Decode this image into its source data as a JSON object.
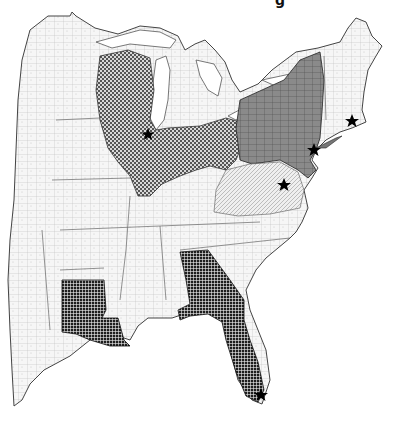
{
  "title_fragment": "g",
  "map": {
    "description": "Eastern United States county map with highlighted states",
    "colors": {
      "background": "#ffffff",
      "land": "#f4f4f4",
      "border": "#555555",
      "county_lines": "#aaaaaa",
      "midwest_checker": "#6a6a6a",
      "northeast_gray": "#7a7a7a",
      "south_grid": "#2a2a2a",
      "star": "#000000"
    },
    "highlighted_regions": [
      {
        "name": "Wisconsin",
        "pattern": "checker"
      },
      {
        "name": "Illinois",
        "pattern": "checker"
      },
      {
        "name": "Indiana",
        "pattern": "checker"
      },
      {
        "name": "Ohio",
        "pattern": "checker"
      },
      {
        "name": "New York",
        "pattern": "gray"
      },
      {
        "name": "Pennsylvania",
        "pattern": "gray"
      },
      {
        "name": "New Jersey",
        "pattern": "gray"
      },
      {
        "name": "Louisiana",
        "pattern": "grid"
      },
      {
        "name": "Georgia",
        "pattern": "grid"
      },
      {
        "name": "Florida",
        "pattern": "grid"
      }
    ],
    "stars": [
      {
        "name": "Chicago",
        "x": 148,
        "y": 134
      },
      {
        "name": "New York City",
        "x": 314,
        "y": 150
      },
      {
        "name": "Boston",
        "x": 352,
        "y": 121
      },
      {
        "name": "Washington DC",
        "x": 284,
        "y": 185
      },
      {
        "name": "Miami",
        "x": 261,
        "y": 395
      }
    ]
  }
}
